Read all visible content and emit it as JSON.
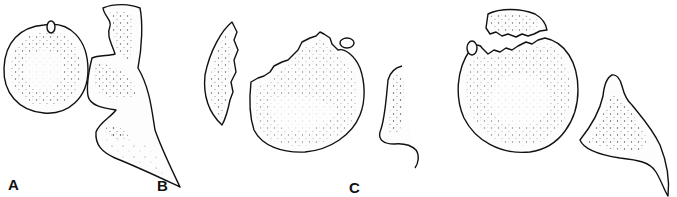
{
  "figure": {
    "panels": [
      {
        "id": "A",
        "label": "A"
      },
      {
        "id": "B",
        "label": "B"
      },
      {
        "id": "C",
        "label": "C"
      }
    ],
    "colors": {
      "outline": "#111111",
      "stipple": "#444444",
      "background": "#ffffff"
    }
  }
}
